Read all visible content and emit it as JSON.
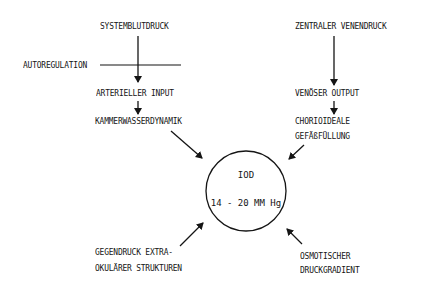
{
  "diagram": {
    "center": {
      "title": "IOD",
      "range": "14 - 20 MM Hg"
    },
    "top_left_chain": {
      "source": "SYSTEMBLUTDRUCK",
      "modifier": "AUTOREGULATION",
      "step1": "ARTERIELLER INPUT",
      "step2": "KAMMERWASSERDYNAMIK"
    },
    "top_right_chain": {
      "source": "ZENTRALER VENENDRUCK",
      "step1": "VENÖSER OUTPUT",
      "step2_line1": "CHORIOIDEALE",
      "step2_line2": "GEFÄßFÜLLUNG"
    },
    "bottom_left": {
      "line1": "GEGENDRUCK EXTRA-",
      "line2": "OKULÄRER STRUKTUREN"
    },
    "bottom_right": {
      "line1": "OSMOTISCHER",
      "line2": "DRUCKGRADIENT"
    },
    "colors": {
      "ink": "#151515",
      "background": "#ffffff"
    }
  }
}
